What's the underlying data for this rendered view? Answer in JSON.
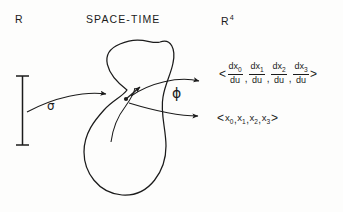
{
  "figure": {
    "labels": {
      "domain": "R",
      "manifold": "SPACE-TIME",
      "codomain_base": "R",
      "codomain_exponent": "4",
      "curve_map": "σ",
      "chart_map": "ϕ"
    },
    "derivative_expression": {
      "open_bracket": "<",
      "close_bracket": ">",
      "separator": ",",
      "terms": [
        {
          "numerator": "dx",
          "numerator_sub": "0",
          "denominator": "du"
        },
        {
          "numerator": "dx",
          "numerator_sub": "1",
          "denominator": "du"
        },
        {
          "numerator": "dx",
          "numerator_sub": "2",
          "denominator": "du"
        },
        {
          "numerator": "dx",
          "numerator_sub": "3",
          "denominator": "du"
        }
      ]
    },
    "coordinate_expression": {
      "open_bracket": "<",
      "close_bracket": ">",
      "separator": ",",
      "terms": [
        {
          "base": "x",
          "sub": "0"
        },
        {
          "base": "x",
          "sub": "1"
        },
        {
          "base": "x",
          "sub": "2"
        },
        {
          "base": "x",
          "sub": "3"
        }
      ]
    },
    "colors": {
      "ink": "#1b1b1b",
      "background": "#fdfdfc"
    }
  }
}
